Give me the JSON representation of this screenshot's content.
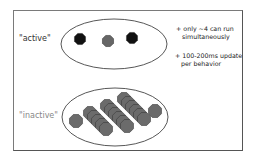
{
  "diagram": {
    "frame": {
      "border_color": "#555555",
      "background": "#ffffff"
    },
    "groups": [
      {
        "id": "active",
        "label": "\"active\"",
        "label_color": "#333333",
        "ellipse": {
          "cx": 114,
          "cy": 44,
          "rx": 53,
          "ry": 25
        },
        "nodes": [
          {
            "x": 80,
            "y": 39,
            "color": "#111111"
          },
          {
            "x": 108,
            "y": 41,
            "color": "#666666"
          },
          {
            "x": 132,
            "y": 38,
            "color": "#111111"
          }
        ]
      },
      {
        "id": "inactive",
        "label": "\"inactive\"",
        "label_color": "#888888",
        "ellipse": {
          "cx": 115,
          "cy": 117,
          "rx": 53,
          "ry": 29
        },
        "node_color": "#6b6b6b",
        "singles": [
          {
            "x": 76,
            "y": 121
          },
          {
            "x": 155,
            "y": 111
          }
        ],
        "stacks": [
          {
            "x0": 90,
            "y0": 113,
            "count": 5,
            "dx": 4,
            "dy": 4
          },
          {
            "x0": 107,
            "y0": 106,
            "count": 6,
            "dx": 4,
            "dy": 4
          },
          {
            "x0": 124,
            "y0": 99,
            "count": 6,
            "dx": 4,
            "dy": 4
          }
        ]
      }
    ],
    "notes": [
      {
        "bullet": "+",
        "line1": "only ~4 can run",
        "line2": "simultaneously"
      },
      {
        "bullet": "+",
        "line1": "100-200ms update",
        "line2": "per behavior"
      }
    ]
  }
}
